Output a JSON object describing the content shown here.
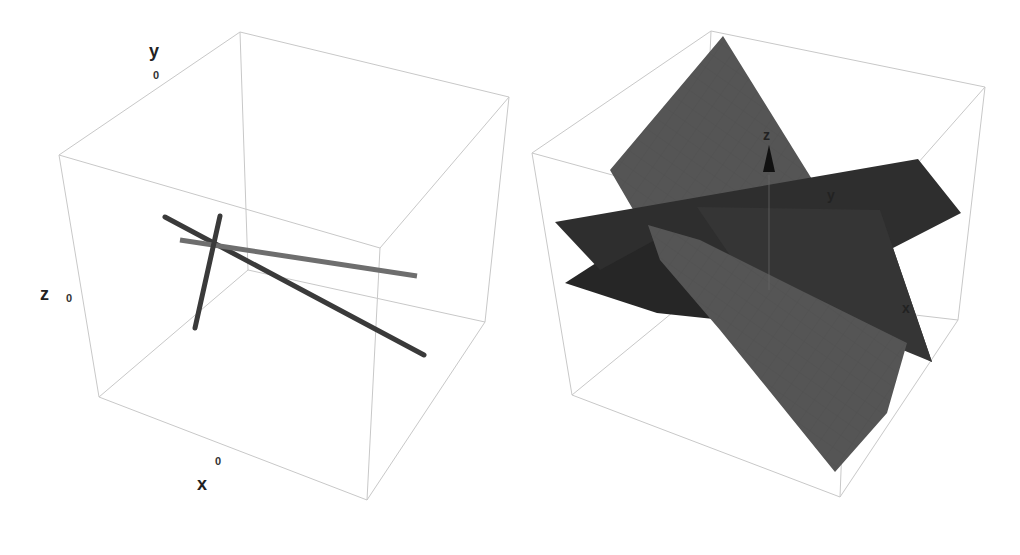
{
  "figure": {
    "left_panel": {
      "type": "3d-line-plot",
      "axes": {
        "x": {
          "label": "x",
          "tick": "0"
        },
        "y": {
          "label": "y",
          "tick": "0"
        },
        "z": {
          "label": "z",
          "tick": "0"
        }
      },
      "lines": [
        {
          "name": "line-1",
          "color": "#3a3a3a"
        },
        {
          "name": "line-2",
          "color": "#6e6e6e"
        },
        {
          "name": "line-3",
          "color": "#3a3a3a"
        }
      ]
    },
    "right_panel": {
      "type": "3d-plane-plot",
      "axes": {
        "x": {
          "label": "x"
        },
        "y": {
          "label": "y"
        },
        "z": {
          "label": "z"
        }
      },
      "planes": [
        {
          "name": "plane-light",
          "color": "#555555"
        },
        {
          "name": "plane-dark-1",
          "color": "#2e2e2e"
        },
        {
          "name": "plane-dark-2",
          "color": "#262626"
        }
      ]
    }
  }
}
